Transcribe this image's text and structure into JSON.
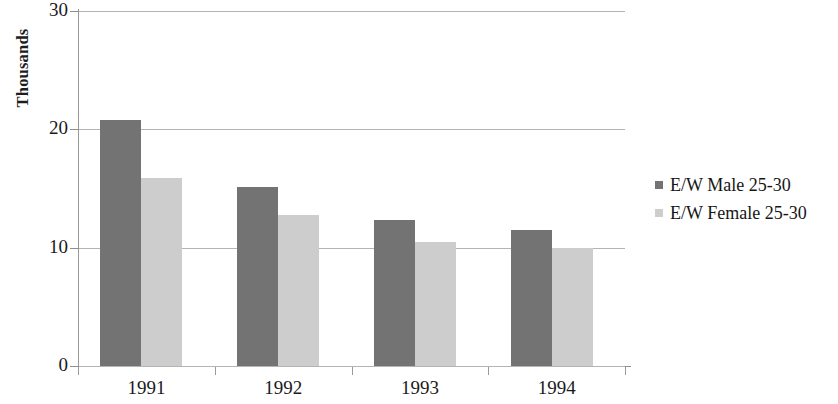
{
  "chart_data": {
    "type": "bar",
    "title": "",
    "subtitle": "",
    "xlabel": "",
    "ylabel": "Thousands",
    "categories": [
      "1991",
      "1992",
      "1993",
      "1994"
    ],
    "series": [
      {
        "name": "E/W Male 25-30",
        "color": "#737373",
        "values": [
          20.8,
          15.1,
          12.3,
          11.5
        ]
      },
      {
        "name": "E/W Female 25-30",
        "color": "#cdcdcd",
        "values": [
          15.9,
          12.8,
          10.5,
          10.0
        ]
      }
    ],
    "ylim": [
      0,
      30
    ],
    "ytick_labels": [
      "0",
      "10",
      "20",
      "30"
    ],
    "ytick_values": [
      0,
      10,
      20,
      30
    ],
    "grid": true,
    "grid_axis": "y",
    "legend_position": "right"
  }
}
